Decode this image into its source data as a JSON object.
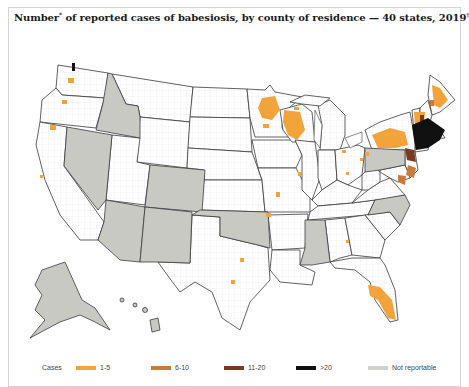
{
  "title": {
    "text": "Number",
    "sup1": "*",
    "rest": " of reported cases of babesiosis, by county of residence — 40 states, 2019",
    "sup2": "†"
  },
  "legend": {
    "label": "Cases",
    "items": [
      {
        "label": "1-5",
        "color": "#f2a33a"
      },
      {
        "label": "6-10",
        "color": "#c77a3a"
      },
      {
        "label": "11-20",
        "color": "#7a3a22"
      },
      {
        "label": ">20",
        "color": "#111111"
      },
      {
        "label": "Not reportable",
        "color": "#d0d0cc"
      }
    ]
  },
  "colors": {
    "not_reportable": "#c9c9c4",
    "reportable": "#ffffff",
    "border": "#3a3a3a",
    "county_line": "#e2e2e2",
    "low": "#f2a33a",
    "mid": "#c77a3a",
    "high": "#7a3a22",
    "very_high": "#111111"
  },
  "map": {
    "not_reportable_states": [
      "Alaska",
      "Hawaii",
      "Idaho",
      "Nevada",
      "Colorado",
      "Arizona",
      "New Mexico",
      "Oklahoma",
      "Mississippi",
      "Pennsylvania",
      "North Carolina"
    ],
    "high_burden_region": "Northeast (Connecticut, Rhode Island, Massachusetts, New York, New Jersey)",
    "cluster_regions": [
      "Minnesota",
      "Wisconsin",
      "New York",
      "Maine",
      "New Hampshire",
      "Florida"
    ]
  }
}
